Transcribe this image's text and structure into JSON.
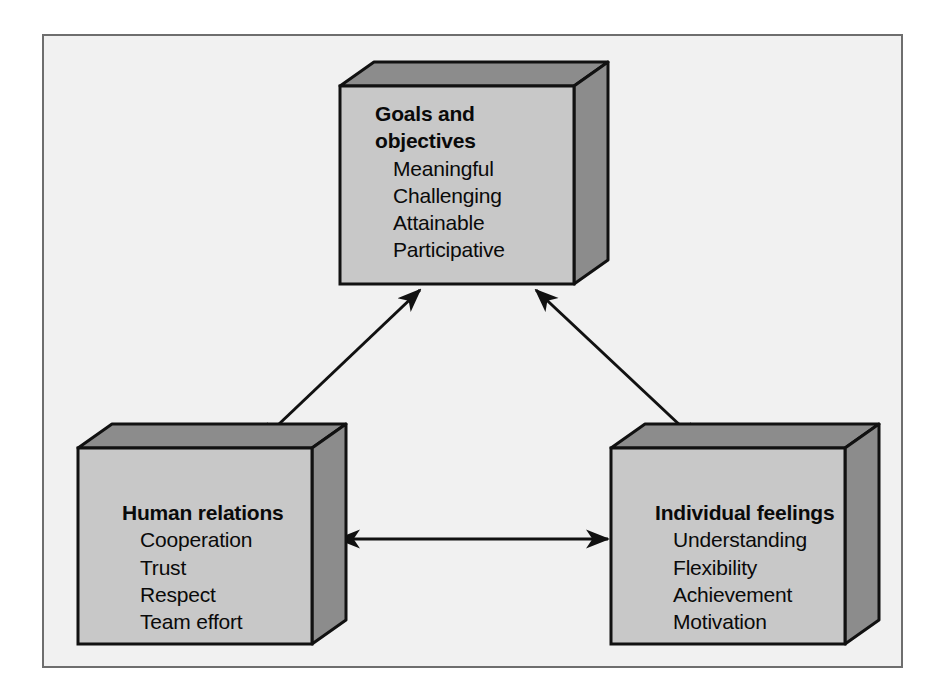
{
  "figure": {
    "kind": "three-dimensional block triangle diagram",
    "colors": {
      "page_background": "#ffffff",
      "plate_background": "#f1f1f1",
      "plate_border": "#6e6e6e",
      "box_front_face": "#c8c8c8",
      "box_top_face": "#8c8c8c",
      "box_side_face": "#8c8c8c",
      "box_outline": "#111111",
      "arrow": "#111111",
      "text": "#0a0a0a"
    }
  },
  "boxes": [
    {
      "id": "goals-and-objectives",
      "position": "top-center",
      "title_line_1": "Goals and",
      "title_line_2": "objectives",
      "items": [
        "Meaningful",
        "Challenging",
        "Attainable",
        "Participative"
      ]
    },
    {
      "id": "human-relations",
      "position": "bottom-left",
      "title_line_1": "Human relations",
      "title_line_2": "",
      "items": [
        "Cooperation",
        "Trust",
        "Respect",
        "Team effort"
      ]
    },
    {
      "id": "individual-feelings",
      "position": "bottom-right",
      "title_line_1": "Individual feelings",
      "title_line_2": "",
      "items": [
        "Understanding",
        "Flexibility",
        "Achievement",
        "Motivation"
      ]
    }
  ],
  "connectors": [
    {
      "id": "human-relations-to-goals",
      "from": "human-relations",
      "to": "goals-and-objectives",
      "style": "double-headed-arrow",
      "orientation": "diagonal-up-right"
    },
    {
      "id": "goals-to-individual-feelings",
      "from": "goals-and-objectives",
      "to": "individual-feelings",
      "style": "double-headed-arrow",
      "orientation": "diagonal-down-right"
    },
    {
      "id": "human-relations-to-individual-feelings",
      "from": "human-relations",
      "to": "individual-feelings",
      "style": "double-headed-arrow",
      "orientation": "horizontal"
    }
  ]
}
